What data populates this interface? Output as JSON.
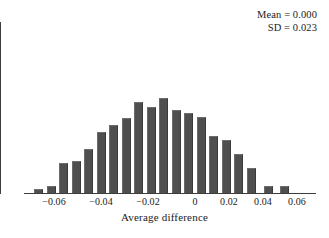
{
  "chart_data": {
    "type": "bar",
    "title": "",
    "subtitle": "",
    "xlabel": "Average difference",
    "ylabel": "",
    "grid": false,
    "legend": null,
    "xlim": [
      -0.072,
      0.072
    ],
    "ylim": [
      0,
      1.0
    ],
    "xticks": [
      -0.06,
      -0.04,
      -0.02,
      0,
      0.02,
      0.04,
      0.06
    ],
    "xticklabels": [
      "−0.06",
      "−0.04",
      "−0.02",
      "0",
      "0.02",
      "0.04",
      "0.06"
    ],
    "bin_width": 0.005,
    "categories": [
      -0.0625,
      -0.0575,
      -0.0525,
      -0.0475,
      -0.0425,
      -0.0375,
      -0.0325,
      -0.0275,
      -0.0225,
      -0.0175,
      -0.0125,
      -0.0075,
      -0.0025,
      0.0025,
      0.0075,
      0.0125,
      0.0175,
      0.0225,
      0.0275,
      0.0325,
      0.0375,
      0.0425,
      0.0475
    ],
    "values": [
      0.04,
      0.07,
      0.0,
      0.3,
      0.325,
      0.445,
      0.0,
      0.615,
      0.68,
      0.755,
      0.91,
      0.86,
      0.955,
      0.83,
      0.805,
      0.76,
      0.0,
      0.57,
      0.53,
      0.39,
      0.0,
      0.075,
      0.07
    ],
    "annotations": [
      "Mean = 0.000",
      "SD = 0.023"
    ],
    "mean_label": "Mean = 0.000",
    "sd_label": "SD = 0.023",
    "bar_color": "#4f4f4f",
    "axis_color": "#3d3d3d"
  },
  "bars": [
    {
      "left": 10.0,
      "width": 9.0,
      "height": 4.0
    },
    {
      "left": 22.5,
      "width": 9.0,
      "height": 7.0
    },
    {
      "left": 35.0,
      "width": 9.0,
      "height": 30.0
    },
    {
      "left": 47.5,
      "width": 9.0,
      "height": 32.5
    },
    {
      "left": 60.0,
      "width": 9.0,
      "height": 44.5
    },
    {
      "left": 72.5,
      "width": 9.0,
      "height": 61.5
    },
    {
      "left": 85.0,
      "width": 9.0,
      "height": 68.0
    },
    {
      "left": 97.5,
      "width": 9.0,
      "height": 75.5
    },
    {
      "left": 110.0,
      "width": 9.0,
      "height": 91.0
    },
    {
      "left": 122.5,
      "width": 9.0,
      "height": 86.0
    },
    {
      "left": 135.0,
      "width": 9.0,
      "height": 95.5
    },
    {
      "left": 147.5,
      "width": 9.0,
      "height": 83.0
    },
    {
      "left": 160.0,
      "width": 9.0,
      "height": 80.5
    },
    {
      "left": 172.5,
      "width": 9.0,
      "height": 76.0
    },
    {
      "left": 185.0,
      "width": 9.0,
      "height": 57.0
    },
    {
      "left": 197.5,
      "width": 9.0,
      "height": 53.0
    },
    {
      "left": 210.0,
      "width": 9.0,
      "height": 39.0
    },
    {
      "left": 222.5,
      "width": 9.0,
      "height": 25.0
    },
    {
      "left": 240.0,
      "width": 9.0,
      "height": 7.5
    },
    {
      "left": 256.0,
      "width": 9.0,
      "height": 7.0
    }
  ],
  "xticks_px": [
    {
      "x": 54.0,
      "label": "−0.06"
    },
    {
      "x": 101.0,
      "label": "−0.04"
    },
    {
      "x": 148.0,
      "label": "−0.02"
    },
    {
      "x": 195.0,
      "label": "0"
    },
    {
      "x": 229.0,
      "label": "0.02"
    },
    {
      "x": 263.0,
      "label": "0.04"
    },
    {
      "x": 297.0,
      "label": "0.06"
    }
  ],
  "axis": {
    "xlabel": "Average difference"
  }
}
